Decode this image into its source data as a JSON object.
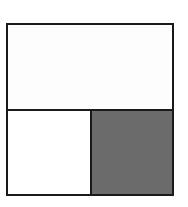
{
  "diagram": {
    "regions": [
      {
        "id": "top-half",
        "fraction": "1/2",
        "shaded": false
      },
      {
        "id": "bottom-left",
        "fraction": "1/4",
        "shaded": false
      },
      {
        "id": "bottom-right",
        "fraction": "1/4",
        "shaded": true
      }
    ],
    "colors": {
      "border": "#1a1a1a",
      "unshaded": "#ffffff",
      "shaded": "#6b6b6b"
    }
  }
}
